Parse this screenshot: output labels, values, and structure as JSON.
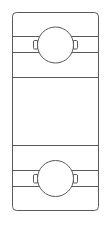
{
  "diagram": {
    "type": "ball-bearing-cross-section",
    "line_color": "#5a5a5a",
    "background": "#ffffff",
    "components": [
      {
        "name": "outer-housing",
        "kind": "rectangle"
      },
      {
        "name": "top-ring",
        "kind": "ring-section",
        "ball": "top-ball"
      },
      {
        "name": "bottom-ring",
        "kind": "ring-section",
        "ball": "bottom-ball"
      }
    ]
  }
}
